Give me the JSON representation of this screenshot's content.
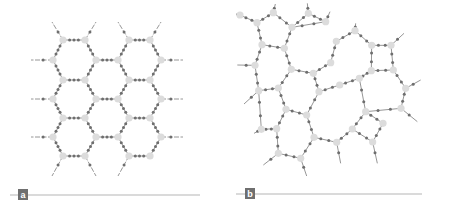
{
  "figure": {
    "panels": [
      {
        "label": "a",
        "description": "crystalline honeycomb network"
      },
      {
        "label": "b",
        "description": "amorphous random network"
      }
    ],
    "colors": {
      "node": "#dcdcdc",
      "bond": "#8a8a8a",
      "bond_atom": "#6e6e6e",
      "rule": "#b5b5b5",
      "badge": "#6f6f6f"
    }
  }
}
